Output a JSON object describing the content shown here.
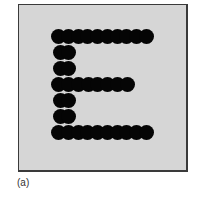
{
  "figure": {
    "caption": "(a)",
    "letter": "E",
    "colors": {
      "background": "#d6d6d6",
      "dot": "#050505",
      "frame": "#3a3a3a"
    },
    "dots": {
      "top_row": {
        "y": 36,
        "x_start": 58,
        "x_end": 146,
        "count": 10
      },
      "middle_row": {
        "y": 84,
        "x_start": 58,
        "x_end": 127,
        "count": 8
      },
      "bottom_row": {
        "y": 132,
        "x_start": 58,
        "x_end": 146,
        "count": 10
      },
      "left_column": {
        "x": 60,
        "ys": [
          52,
          68,
          100,
          116
        ]
      }
    }
  }
}
